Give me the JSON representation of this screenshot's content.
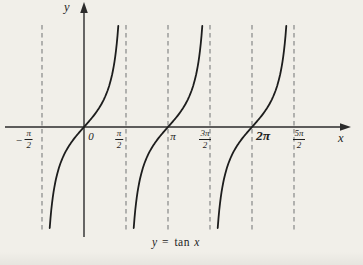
{
  "figure": {
    "background": "#f1efe9",
    "ink": "#1d1d1d",
    "axis_color": "#2b2b2b",
    "dash_color": "#8f8f8f",
    "y_axis_label": "y",
    "x_axis_label": "x",
    "origin_label": "0",
    "caption": {
      "lhs": "y",
      "eq": "=",
      "fn": "tan",
      "arg": "x"
    },
    "x_ticks": [
      {
        "id": "neg-half-pi",
        "kind": "fraction",
        "prefix": "−",
        "num": "π",
        "den": "2",
        "value_rad": -1.570796
      },
      {
        "id": "zero",
        "kind": "plain",
        "text": "0",
        "value_rad": 0
      },
      {
        "id": "half-pi",
        "kind": "fraction",
        "num": "π",
        "den": "2",
        "value_rad": 1.570796
      },
      {
        "id": "pi",
        "kind": "plain",
        "text": "π",
        "value_rad": 3.141593
      },
      {
        "id": "three-half-pi",
        "kind": "fraction",
        "num": "3π",
        "den": "2",
        "value_rad": 4.712389
      },
      {
        "id": "two-pi",
        "kind": "plain",
        "text": "2π",
        "large": true,
        "value_rad": 6.283185
      },
      {
        "id": "five-half-pi",
        "kind": "fraction",
        "num": "5π",
        "den": "2",
        "value_rad": 7.853982
      }
    ]
  },
  "chart_data": {
    "type": "line",
    "title": "y = tan x",
    "function": "y = tan(x)",
    "xlabel": "x",
    "ylabel": "y",
    "grid": false,
    "legend": false,
    "x_tick_labels": [
      "-π/2",
      "0",
      "π/2",
      "π",
      "3π/2",
      "2π",
      "5π/2"
    ],
    "x_tick_values_rad": [
      -1.570796,
      0,
      1.570796,
      3.141593,
      4.712389,
      6.283185,
      7.853982
    ],
    "branch_centers_rad": [
      0,
      3.141593,
      6.283185
    ],
    "zeros_rad": [
      0,
      3.141593,
      6.283185
    ],
    "vertical_asymptotes_rad": [
      -1.570796,
      1.570796,
      4.712389,
      7.853982
    ],
    "dashed_vertical_lines_rad": [
      -1.570796,
      1.570796,
      3.141593,
      4.712389,
      6.283185,
      7.853982
    ],
    "y_clip": [
      -3.37,
      3.37
    ],
    "x_range_rad": [
      -2.95,
      10.0
    ]
  }
}
